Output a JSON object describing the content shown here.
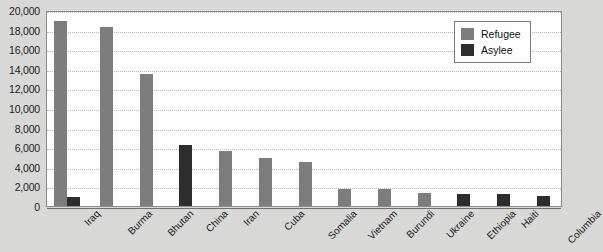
{
  "chart_data": {
    "type": "bar",
    "title": "",
    "subtitle": "",
    "xlabel": "",
    "ylabel": "",
    "ylim": [
      0,
      20000
    ],
    "ytick_step": 2000,
    "ytick_labels": [
      "20,000",
      "18,000",
      "16,000",
      "14,000",
      "12,000",
      "10,000",
      "8,000",
      "6,000",
      "4,000",
      "2,000",
      "0"
    ],
    "grid": true,
    "legend_position": "top-right",
    "categories": [
      "Iraq",
      "Burma",
      "Bhutan",
      "China",
      "Iran",
      "Cuba",
      "Somalia",
      "Vietnam",
      "Burundi",
      "Ukraine",
      "Ethiopia",
      "Haiti",
      "Columbia"
    ],
    "series": [
      {
        "name": "Refugee",
        "color": "#7d7d7d",
        "values": [
          18900,
          18300,
          13500,
          null,
          5600,
          4950,
          4450,
          1750,
          1700,
          1350,
          null,
          null,
          null
        ]
      },
      {
        "name": "Asylee",
        "color": "#2d2d2d",
        "values": [
          900,
          null,
          null,
          6200,
          null,
          null,
          null,
          null,
          null,
          null,
          1200,
          1200,
          1050
        ]
      }
    ],
    "bars": [
      {
        "category": "Iraq",
        "series": "Refugee",
        "value": 18900
      },
      {
        "category": "Iraq",
        "series": "Asylee",
        "value": 900
      },
      {
        "category": "Burma",
        "series": "Refugee",
        "value": 18300
      },
      {
        "category": "Bhutan",
        "series": "Refugee",
        "value": 13500
      },
      {
        "category": "China",
        "series": "Asylee",
        "value": 6200
      },
      {
        "category": "Iran",
        "series": "Refugee",
        "value": 5600
      },
      {
        "category": "Cuba",
        "series": "Refugee",
        "value": 4950
      },
      {
        "category": "Somalia",
        "series": "Refugee",
        "value": 4450
      },
      {
        "category": "Vietnam",
        "series": "Refugee",
        "value": 1750
      },
      {
        "category": "Burundi",
        "series": "Refugee",
        "value": 1700
      },
      {
        "category": "Ukraine",
        "series": "Refugee",
        "value": 1350
      },
      {
        "category": "Ethiopia",
        "series": "Asylee",
        "value": 1200
      },
      {
        "category": "Haiti",
        "series": "Asylee",
        "value": 1200
      },
      {
        "category": "Columbia",
        "series": "Asylee",
        "value": 1050
      }
    ]
  },
  "legend": {
    "items": [
      {
        "label": "Refugee",
        "key": "refugee"
      },
      {
        "label": "Asylee",
        "key": "asylee"
      }
    ]
  },
  "colors": {
    "refugee": "#7d7d7d",
    "asylee": "#2d2d2d",
    "plot_background": "#fdfdfd",
    "page_background": "#d8d8d6",
    "gridline": "#b9b9b9",
    "axis": "#6e6e6e"
  }
}
